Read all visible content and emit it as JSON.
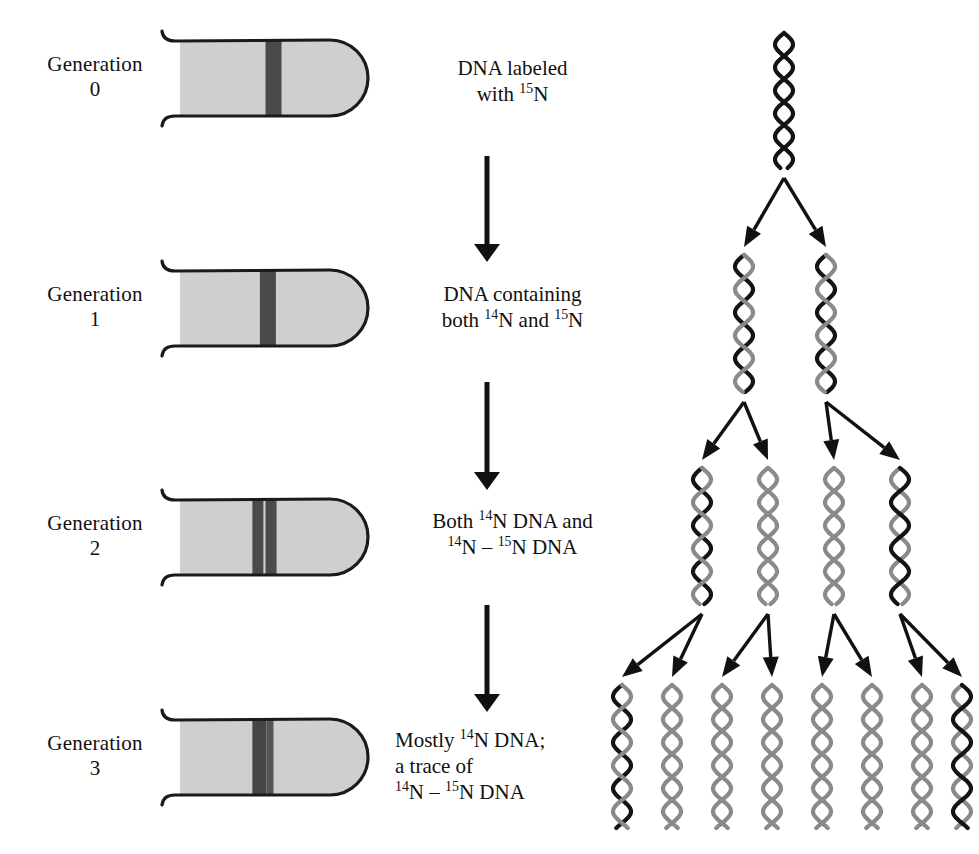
{
  "figure": {
    "colors": {
      "ink": "#111111",
      "tube_fill": "#cfcfcf",
      "tube_outline": "#1a1a1a",
      "band_dark": "#4a4a4a",
      "band_darker": "#3d3d3d",
      "strand_heavy": "#141414",
      "strand_light": "#8a8a8a",
      "background": "#ffffff"
    }
  },
  "generations": [
    {
      "label": "Generation",
      "number": "0",
      "tube": {
        "name": "centrifuge-tube-gen0",
        "bands": [
          {
            "name": "band-15N",
            "x_frac": 0.455,
            "width": 16,
            "color": "#4a4a4a"
          }
        ]
      }
    },
    {
      "label": "Generation",
      "number": "1",
      "tube": {
        "name": "centrifuge-tube-gen1",
        "bands": [
          {
            "name": "band-hybrid",
            "x_frac": 0.425,
            "width": 16,
            "color": "#4a4a4a"
          }
        ]
      }
    },
    {
      "label": "Generation",
      "number": "2",
      "tube": {
        "name": "centrifuge-tube-gen2",
        "bands": [
          {
            "name": "band-14N",
            "x_frac": 0.385,
            "width": 11,
            "color": "#4a4a4a"
          },
          {
            "name": "band-hybrid",
            "x_frac": 0.455,
            "width": 11,
            "color": "#4a4a4a"
          }
        ]
      }
    },
    {
      "label": "Generation",
      "number": "3",
      "tube": {
        "name": "centrifuge-tube-gen3",
        "bands": [
          {
            "name": "band-14N",
            "x_frac": 0.385,
            "width": 14,
            "color": "#454545"
          },
          {
            "name": "band-hybrid-trace",
            "x_frac": 0.46,
            "width": 7,
            "color": "#555555"
          }
        ]
      }
    }
  ],
  "steps": [
    {
      "name": "step-gen0",
      "align": "center",
      "lines": [
        [
          {
            "t": "DNA labeled"
          }
        ],
        [
          {
            "t": "with "
          },
          {
            "t": "15",
            "sup": true
          },
          {
            "t": "N"
          }
        ]
      ]
    },
    {
      "name": "step-gen1",
      "align": "center",
      "lines": [
        [
          {
            "t": "DNA containing"
          }
        ],
        [
          {
            "t": "both "
          },
          {
            "t": "14",
            "sup": true
          },
          {
            "t": "N and "
          },
          {
            "t": "15",
            "sup": true
          },
          {
            "t": "N"
          }
        ]
      ]
    },
    {
      "name": "step-gen2",
      "align": "center",
      "lines": [
        [
          {
            "t": "Both "
          },
          {
            "t": "14",
            "sup": true
          },
          {
            "t": "N DNA and"
          }
        ],
        [
          {
            "t": "14",
            "sup": true
          },
          {
            "t": "N – "
          },
          {
            "t": "15",
            "sup": true
          },
          {
            "t": "N DNA"
          }
        ]
      ]
    },
    {
      "name": "step-gen3",
      "align": "left",
      "lines": [
        [
          {
            "t": "Mostly "
          },
          {
            "t": "14",
            "sup": true
          },
          {
            "t": "N DNA;"
          }
        ],
        [
          {
            "t": "a trace of"
          }
        ],
        [
          {
            "t": "14",
            "sup": true
          },
          {
            "t": "N – "
          },
          {
            "t": "15",
            "sup": true
          },
          {
            "t": "N DNA"
          }
        ]
      ]
    }
  ],
  "flow_arrows": [
    {
      "name": "flow-arrow-0-to-1",
      "from_step": 0,
      "to_step": 1
    },
    {
      "name": "flow-arrow-1-to-2",
      "from_step": 1,
      "to_step": 2
    },
    {
      "name": "flow-arrow-2-to-3",
      "from_step": 2,
      "to_step": 3
    }
  ],
  "helix_rows": [
    {
      "name": "helix-row-gen0",
      "generation": "0",
      "count": 1,
      "helices": [
        {
          "name": "helix-heavy-heavy",
          "left_strand": "heavy",
          "right_strand": "heavy"
        }
      ]
    },
    {
      "name": "helix-row-gen1",
      "generation": "1",
      "count": 2,
      "helices": [
        {
          "name": "helix-hybrid",
          "left_strand": "light",
          "right_strand": "heavy"
        },
        {
          "name": "helix-hybrid",
          "left_strand": "light",
          "right_strand": "heavy"
        }
      ]
    },
    {
      "name": "helix-row-gen2",
      "generation": "2",
      "count": 4,
      "helices": [
        {
          "name": "helix-hybrid",
          "left_strand": "light",
          "right_strand": "heavy"
        },
        {
          "name": "helix-light",
          "left_strand": "light",
          "right_strand": "light"
        },
        {
          "name": "helix-light",
          "left_strand": "light",
          "right_strand": "light"
        },
        {
          "name": "helix-hybrid",
          "left_strand": "heavy",
          "right_strand": "light"
        }
      ]
    },
    {
      "name": "helix-row-gen3",
      "generation": "3",
      "count": 8,
      "helices": [
        {
          "name": "helix-hybrid",
          "left_strand": "light",
          "right_strand": "heavy"
        },
        {
          "name": "helix-light",
          "left_strand": "light",
          "right_strand": "light"
        },
        {
          "name": "helix-light",
          "left_strand": "light",
          "right_strand": "light"
        },
        {
          "name": "helix-light",
          "left_strand": "light",
          "right_strand": "light"
        },
        {
          "name": "helix-light",
          "left_strand": "light",
          "right_strand": "light"
        },
        {
          "name": "helix-light",
          "left_strand": "light",
          "right_strand": "light"
        },
        {
          "name": "helix-light",
          "left_strand": "light",
          "right_strand": "light"
        },
        {
          "name": "helix-hybrid",
          "left_strand": "heavy",
          "right_strand": "light"
        }
      ]
    }
  ],
  "branch_arrow_sets": [
    {
      "name": "branch-arrows-gen0-to-gen1",
      "count": 2
    },
    {
      "name": "branch-arrows-gen1-to-gen2",
      "count": 4
    },
    {
      "name": "branch-arrows-gen2-to-gen3",
      "count": 8
    }
  ]
}
